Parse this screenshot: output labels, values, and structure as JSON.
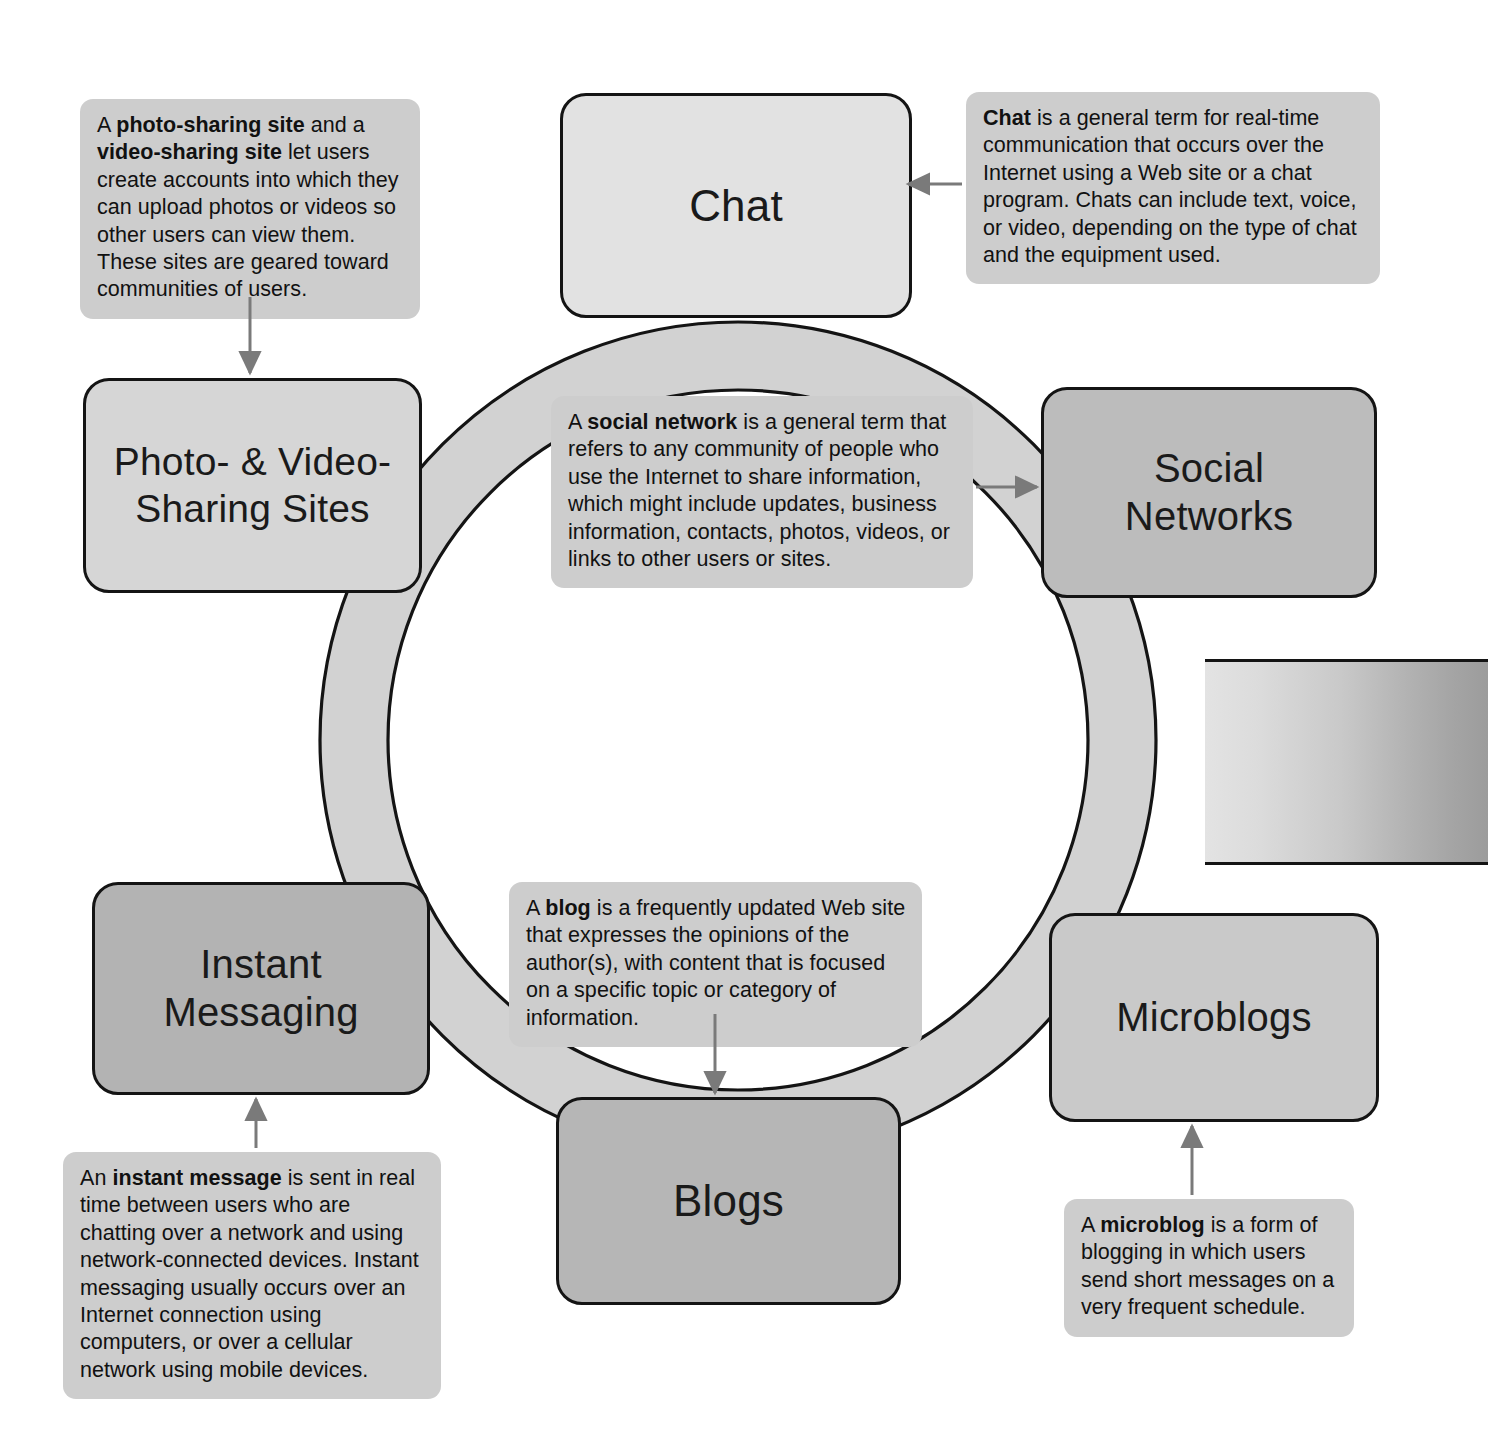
{
  "diagram": {
    "layout": "ring",
    "colors": {
      "ring_fill": "#d2d2d2",
      "outline": "#141414",
      "callout_fill": "#cdcdcd",
      "arrow": "#7a7a7a",
      "text": "#111111",
      "page_background": "#ffffff"
    }
  },
  "nodes": [
    {
      "id": "chat",
      "label": "Chat",
      "fill": "#e2e2e2",
      "font_size": "44px"
    },
    {
      "id": "social-networks",
      "label": "Social\nNetworks",
      "fill": "#bcbcbc",
      "font_size": "40px"
    },
    {
      "id": "microblogs",
      "label": "Microblogs",
      "fill": "#c9c9c9",
      "font_size": "40px"
    },
    {
      "id": "blogs",
      "label": "Blogs",
      "fill": "#b6b6b6",
      "font_size": "44px"
    },
    {
      "id": "instant-messaging",
      "label": "Instant\nMessaging",
      "fill": "#b3b3b3",
      "font_size": "40px"
    },
    {
      "id": "photo-video-sharing-sites",
      "label": "Photo- & Video-\nSharing Sites",
      "fill": "#d6d6d6",
      "font_size": "39px"
    }
  ],
  "callouts": {
    "photo_video": {
      "target": "photo-video-sharing-sites",
      "text_parts": [
        {
          "text": "A ",
          "bold": false
        },
        {
          "text": "photo-sharing site",
          "bold": true
        },
        {
          "text": " and a ",
          "bold": false
        },
        {
          "text": "video-sharing site",
          "bold": true
        },
        {
          "text": " let users create accounts into which they can upload photos or videos so other users can view them. These sites are geared toward communities of users.",
          "bold": false
        }
      ],
      "plain": "A photo-sharing site and a video-sharing site let users create accounts into which they can upload photos or videos so other users can view them. These sites are geared toward communities of users."
    },
    "chat": {
      "target": "chat",
      "text_parts": [
        {
          "text": "Chat",
          "bold": true
        },
        {
          "text": " is a general term for real-time communication that occurs over the Internet using a Web site or a chat program. Chats can include text, voice, or video, depending on the type of chat and the equipment used.",
          "bold": false
        }
      ],
      "plain": "Chat is a general term for real-time communication that occurs over the Internet using a Web site or a chat program. Chats can include text, voice, or video, depending on the type of chat and the equipment used."
    },
    "social_network": {
      "target": "social-networks",
      "text_parts": [
        {
          "text": "A ",
          "bold": false
        },
        {
          "text": "social network",
          "bold": true
        },
        {
          "text": " is a general term that refers to any community of people who use the Internet to share information, which might include updates, business information, contacts, photos, videos, or links to other users or sites.",
          "bold": false
        }
      ],
      "plain": "A social network is a general term that refers to any community of people who use the Internet to share information, which might include updates, business information, contacts, photos, videos, or links to other users or sites."
    },
    "blog": {
      "target": "blogs",
      "text_parts": [
        {
          "text": "A ",
          "bold": false
        },
        {
          "text": "blog",
          "bold": true
        },
        {
          "text": " is a frequently updated Web site that expresses the opinions of the author(s), with content that is focused on a specific topic or category of information.",
          "bold": false
        }
      ],
      "plain": "A blog is a frequently updated Web site that expresses the opinions of the author(s), with content that is focused on a specific topic or category of information."
    },
    "instant_message": {
      "target": "instant-messaging",
      "text_parts": [
        {
          "text": "An ",
          "bold": false
        },
        {
          "text": "instant message",
          "bold": true
        },
        {
          "text": " is sent in real time between users who are chatting over a network and using network-connected devices. Instant messaging usually occurs over an Internet connection using computers, or over a cellular network using mobile devices.",
          "bold": false
        }
      ],
      "plain": "An instant message is sent in real time between users who are chatting over a network and using network-connected devices. Instant messaging usually occurs over an Internet connection using computers, or over a cellular network using mobile devices."
    },
    "microblog": {
      "target": "microblogs",
      "text_parts": [
        {
          "text": "A ",
          "bold": false
        },
        {
          "text": "microblog",
          "bold": true
        },
        {
          "text": " is a form of blogging in which users send short messages on a very frequent schedule.",
          "bold": false
        }
      ],
      "plain": "A microblog is a form of blogging in which users send short messages on a very frequent schedule."
    }
  },
  "page_artifact": ""
}
